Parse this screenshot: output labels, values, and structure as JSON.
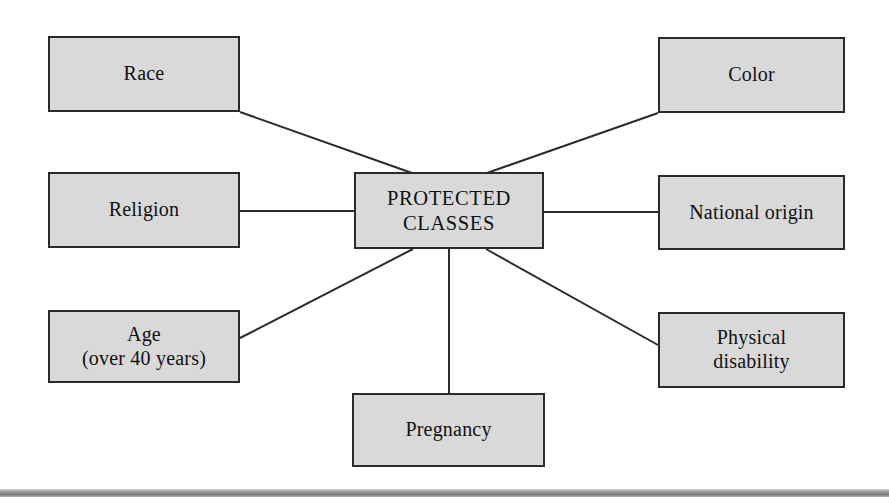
{
  "diagram": {
    "title": "Protected Classes",
    "type": "hub-and-spoke",
    "colors": {
      "node_fill": "#d9d9d9",
      "node_border": "#2b2b2b",
      "edge": "#2b2b2b",
      "background": "#ffffff",
      "footer_rule": "#9b9b9b"
    },
    "center": {
      "id": "protected-classes",
      "label": "PROTECTED\nCLASSES",
      "x": 354,
      "y": 172,
      "w": 190,
      "h": 77
    },
    "nodes": [
      {
        "id": "race",
        "label": "Race",
        "x": 48,
        "y": 36,
        "w": 192,
        "h": 76
      },
      {
        "id": "color",
        "label": "Color",
        "x": 658,
        "y": 37,
        "w": 187,
        "h": 76
      },
      {
        "id": "religion",
        "label": "Religion",
        "x": 48,
        "y": 172,
        "w": 192,
        "h": 76
      },
      {
        "id": "national-origin",
        "label": "National origin",
        "x": 658,
        "y": 175,
        "w": 187,
        "h": 75
      },
      {
        "id": "age",
        "label": "Age\n(over 40 years)",
        "x": 48,
        "y": 310,
        "w": 192,
        "h": 73
      },
      {
        "id": "physical-disability",
        "label": "Physical\ndisability",
        "x": 658,
        "y": 312,
        "w": 187,
        "h": 76
      },
      {
        "id": "pregnancy",
        "label": "Pregnancy",
        "x": 352,
        "y": 393,
        "w": 193,
        "h": 74
      }
    ],
    "edges": [
      {
        "id": "edge-race",
        "from": "race",
        "to": "protected-classes",
        "x1": 240,
        "y1": 112,
        "x2": 412,
        "y2": 173
      },
      {
        "id": "edge-color",
        "from": "color",
        "to": "protected-classes",
        "x1": 658,
        "y1": 113,
        "x2": 487,
        "y2": 173
      },
      {
        "id": "edge-religion",
        "from": "religion",
        "to": "protected-classes",
        "x1": 240,
        "y1": 211,
        "x2": 354,
        "y2": 211
      },
      {
        "id": "edge-national-origin",
        "from": "national-origin",
        "to": "protected-classes",
        "x1": 658,
        "y1": 212,
        "x2": 544,
        "y2": 212
      },
      {
        "id": "edge-age",
        "from": "age",
        "to": "protected-classes",
        "x1": 240,
        "y1": 338,
        "x2": 413,
        "y2": 249
      },
      {
        "id": "edge-physical-disability",
        "from": "physical-disability",
        "to": "protected-classes",
        "x1": 658,
        "y1": 345,
        "x2": 486,
        "y2": 249
      },
      {
        "id": "edge-pregnancy",
        "from": "pregnancy",
        "to": "protected-classes",
        "x1": 449,
        "y1": 393,
        "x2": 449,
        "y2": 249
      }
    ],
    "footer_rule": {
      "x": 0,
      "y": 489,
      "w": 889,
      "h": 8
    }
  }
}
